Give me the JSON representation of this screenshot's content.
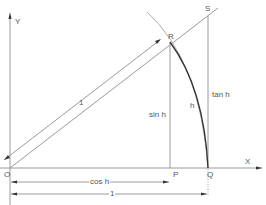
{
  "diagram": {
    "type": "unit-circle-trig",
    "labels": {
      "y_axis": "Y",
      "x_axis": "X",
      "origin": "O",
      "point_p": "P",
      "point_q": "Q",
      "point_r": "R",
      "point_s": "S",
      "radius": "1",
      "sin": "sin h",
      "tan": "tan h",
      "arc": "h",
      "cos": "cos h",
      "unit_length": "1"
    },
    "colors": {
      "line": "#9a9a9a",
      "arc": "#333333",
      "text": "#555555"
    }
  }
}
